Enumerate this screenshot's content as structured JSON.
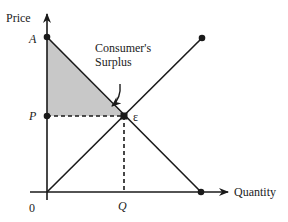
{
  "diagram": {
    "axes": {
      "y_label": "Price",
      "x_label": "Quantity",
      "origin_label": "0"
    },
    "points": {
      "A": {
        "label": "A"
      },
      "P": {
        "label": "P"
      },
      "Q": {
        "label": "Q"
      },
      "equilibrium": {
        "label": "ε"
      }
    },
    "annotation": {
      "line1": "Consumer's",
      "line2": "Surplus"
    },
    "curves": [
      {
        "name": "demand",
        "from": "A",
        "to": "quantity-axis endpoint"
      },
      {
        "name": "supply",
        "from": "origin",
        "to": "upper-right endpoint"
      }
    ],
    "shaded_region": {
      "name": "consumer-surplus",
      "vertices": [
        "A",
        "P",
        "ε"
      ],
      "color": "#c8c8c8"
    },
    "colors": {
      "line": "#1a1a1a",
      "fill": "#c8c8c8",
      "background": "#ffffff"
    }
  }
}
